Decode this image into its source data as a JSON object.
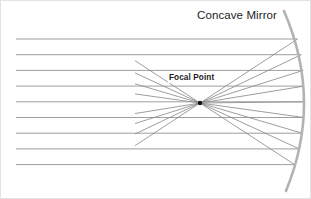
{
  "figure": {
    "title": "Concave Mirror",
    "focal_label": "Focal Point",
    "background_color": "#ffffff",
    "border_color": "#e3e3e3",
    "text_color": "#1c1c1c"
  },
  "chart_data": {
    "type": "diagram",
    "title": "Concave Mirror",
    "xlabel": "",
    "ylabel": "",
    "annotations": [
      {
        "text": "Concave Mirror",
        "x": 196,
        "y": 16
      },
      {
        "text": "Focal Point",
        "x": 167,
        "y": 79
      }
    ],
    "focal_point": {
      "x": 199,
      "y": 102,
      "label": "Focal Point"
    },
    "mirror": {
      "name": "concave-mirror-arc",
      "color": "#b3b3b3",
      "stroke_width": 2.6,
      "start": {
        "x": 283,
        "y": 10
      },
      "apex": {
        "x": 303,
        "y": 100
      },
      "end": {
        "x": 285,
        "y": 190
      }
    },
    "incoming_rays": {
      "name": "parallel-incident-rays",
      "color": "#8c8c8c",
      "stroke_width": 0.85,
      "x_start": 15,
      "count": 9,
      "y_values": [
        38,
        53.7,
        69.4,
        85.1,
        100.8,
        116.5,
        132.2,
        147.9,
        163.6
      ],
      "x_end_values": [
        296.5,
        300.2,
        302.2,
        303.0,
        303.2,
        302.8,
        301.2,
        298.2,
        293.6
      ]
    },
    "reflected_rays": {
      "name": "reflected-converging-rays",
      "color": "#8c8c8c",
      "stroke_width": 0.85,
      "description": "Rays reflect off the mirror surface and converge at the focal point, continuing through to diverge on the left."
    },
    "diverging_rays": {
      "name": "diverging-rays-past-focus",
      "color": "#8c8c8c",
      "stroke_width": 0.85,
      "x_min": 134
    },
    "grid": false,
    "legend": false
  }
}
